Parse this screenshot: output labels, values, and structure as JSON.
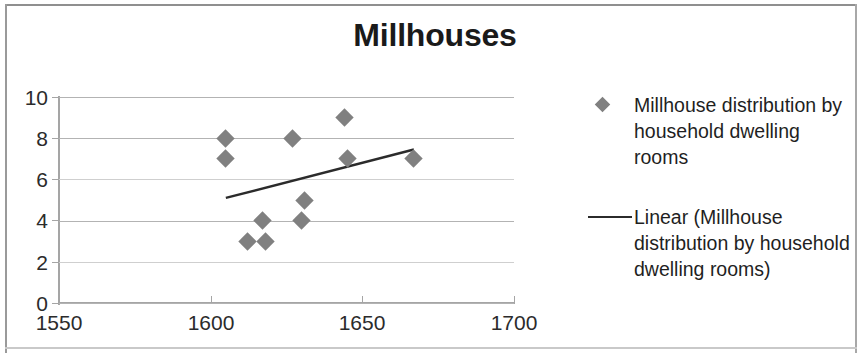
{
  "chart_data": {
    "type": "scatter",
    "title": "Millhouses",
    "xlabel": "",
    "ylabel": "",
    "xlim": [
      1550,
      1700
    ],
    "ylim": [
      0,
      10
    ],
    "xticks": [
      1550,
      1600,
      1650,
      1700
    ],
    "yticks": [
      0,
      2,
      4,
      6,
      8,
      10
    ],
    "grid": true,
    "legend_position": "right",
    "series": [
      {
        "name": "Millhouse distribution by household dwelling rooms",
        "type": "scatter",
        "marker": "diamond",
        "color": "#808080",
        "points": [
          {
            "x": 1605,
            "y": 8
          },
          {
            "x": 1605,
            "y": 7
          },
          {
            "x": 1612,
            "y": 3
          },
          {
            "x": 1617,
            "y": 4
          },
          {
            "x": 1618,
            "y": 3
          },
          {
            "x": 1627,
            "y": 8
          },
          {
            "x": 1630,
            "y": 4
          },
          {
            "x": 1631,
            "y": 5
          },
          {
            "x": 1644,
            "y": 9
          },
          {
            "x": 1645,
            "y": 7
          },
          {
            "x": 1667,
            "y": 7
          }
        ]
      },
      {
        "name": "Linear (Millhouse distribution by household dwelling rooms)",
        "type": "line",
        "color": "#2b2b2b",
        "points": [
          {
            "x": 1605,
            "y": 5.1
          },
          {
            "x": 1667,
            "y": 7.45
          }
        ]
      }
    ]
  },
  "axes": {
    "y_tick_labels": [
      "10",
      "8",
      "6",
      "4",
      "2",
      "0"
    ],
    "x_tick_labels": [
      "1550",
      "1600",
      "1650",
      "1700"
    ]
  },
  "legend": {
    "entries": [
      {
        "key": "diamond-marker",
        "label": "Millhouse distribution by household dwelling rooms"
      },
      {
        "key": "line-swatch",
        "label": "Linear (Millhouse distribution by household dwelling rooms)"
      }
    ]
  },
  "colors": {
    "marker": "#808080",
    "trendline": "#2b2b2b",
    "gridline": "#b3b3b3",
    "axis": "#a5a5a5",
    "text": "#1f1f1f"
  }
}
